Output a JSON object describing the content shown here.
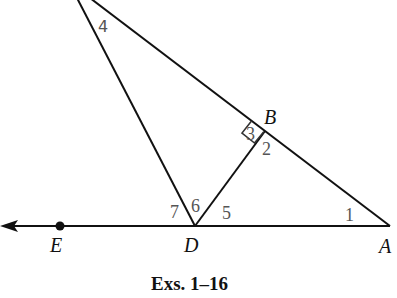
{
  "diagram": {
    "points": [
      {
        "label": "B",
        "x": 265,
        "y": 131
      },
      {
        "label": "D",
        "x": 195,
        "y": 226
      },
      {
        "label": "A",
        "x": 390,
        "y": 226
      },
      {
        "label": "E",
        "x": 60,
        "y": 226
      }
    ],
    "angle_labels": [
      "1",
      "2",
      "3",
      "4",
      "5",
      "6",
      "7"
    ],
    "right_angle_at": "B",
    "segments": [
      "DA",
      "DB",
      "BA",
      "ray from D through E"
    ],
    "caption": "Exs. 1–16"
  },
  "colors": {
    "line": "#111111",
    "angle_label": "#555555"
  }
}
